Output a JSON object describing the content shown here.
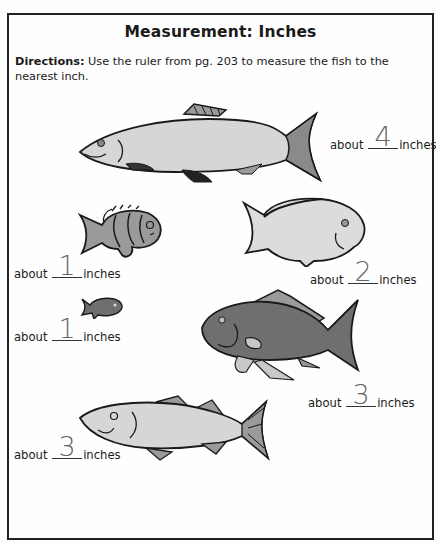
{
  "worksheet": {
    "title": "Measurement: Inches",
    "directions_label": "Directions:",
    "directions_text": " Use the ruler from pg. 203 to measure the fish to the nearest inch."
  },
  "fish": [
    {
      "id": "large-silver-fish",
      "prefix": "about",
      "answer": "4",
      "suffix": "inches"
    },
    {
      "id": "striped-fish",
      "prefix": "about",
      "answer": "1",
      "suffix": "inches"
    },
    {
      "id": "pale-round-fish",
      "prefix": "about",
      "answer": "2",
      "suffix": "inches"
    },
    {
      "id": "tiny-dark-fish",
      "prefix": "about",
      "answer": "1",
      "suffix": "inches"
    },
    {
      "id": "dark-big-fish",
      "prefix": "about",
      "answer": "3",
      "suffix": "inches"
    },
    {
      "id": "long-light-fish",
      "prefix": "about",
      "answer": "3",
      "suffix": "inches"
    }
  ],
  "colors": {
    "light_fill": "#d6d6d6",
    "mid_fill": "#9a9a9a",
    "dark_fill": "#6f6f6f",
    "outline": "#1a1a1a",
    "handwriting": "#666666"
  }
}
